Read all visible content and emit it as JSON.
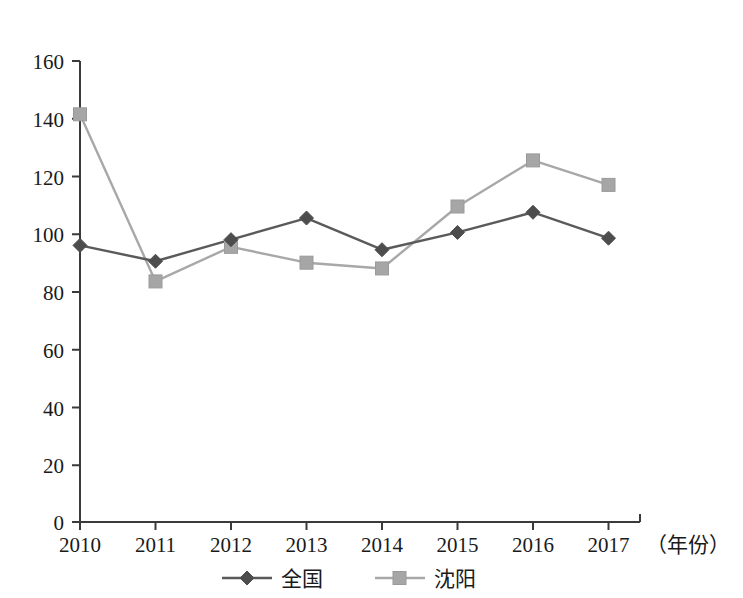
{
  "chart_data": {
    "type": "line",
    "title": "",
    "xlabel": "（年份）",
    "ylabel": "",
    "categories": [
      "2010",
      "2011",
      "2012",
      "2013",
      "2014",
      "2015",
      "2016",
      "2017"
    ],
    "xlim": [
      2010,
      2017
    ],
    "ylim": [
      0,
      160
    ],
    "yticks": [
      "0",
      "20",
      "40",
      "60",
      "80",
      "100",
      "120",
      "140",
      "160"
    ],
    "grid": false,
    "legend_position": "bottom",
    "series": [
      {
        "name": "全国",
        "marker": "diamond",
        "color": "#4d4d4d",
        "values": [
          96,
          90.5,
          98,
          105.5,
          94.5,
          100.5,
          107.5,
          98.5
        ]
      },
      {
        "name": "沈阳",
        "marker": "square",
        "color": "#a6a6a6",
        "values": [
          141.5,
          83.5,
          95.5,
          90,
          88,
          109.5,
          125.5,
          117
        ]
      }
    ]
  },
  "legend": {
    "items": [
      {
        "label": "全国",
        "marker": "diamond-marker",
        "color": "#4d4d4d"
      },
      {
        "label": "沈阳",
        "marker": "square-marker",
        "color": "#a6a6a6"
      }
    ]
  },
  "axis": {
    "x_caption": "（年份）"
  }
}
